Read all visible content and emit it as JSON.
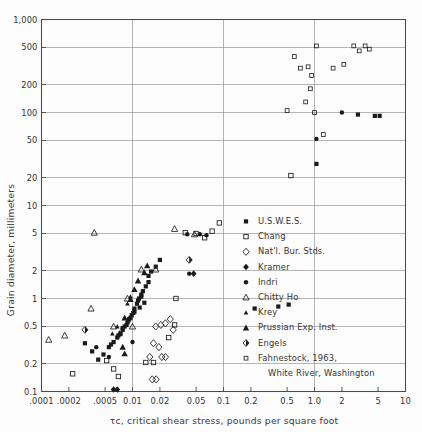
{
  "chart_data": {
    "type": "scatter",
    "title": "",
    "xlabel": "τc, critical shear stress, pounds per square foot",
    "ylabel": "Grain diameter, millimeters",
    "xscale": "log",
    "yscale": "log",
    "xlim": [
      0.001,
      10
    ],
    "ylim": [
      0.1,
      1000
    ],
    "grid": true,
    "legend_position": "inside-right",
    "xticks": [
      0.001,
      0.002,
      0.005,
      0.01,
      0.02,
      0.05,
      0.1,
      0.2,
      0.5,
      1.0,
      2,
      5,
      10
    ],
    "xtick_labels": [
      ".0001",
      ".0002",
      ".0005",
      "0.01",
      "0.02",
      "0.05",
      "0.1",
      "0.2",
      "0.5",
      "1.0",
      "2",
      "5",
      "10"
    ],
    "yticks": [
      0.1,
      0.2,
      0.5,
      1,
      2,
      5,
      10,
      20,
      50,
      100,
      200,
      500,
      1000
    ],
    "ytick_labels": [
      "0.1",
      "0.2",
      "0.5",
      "1",
      "2",
      "5",
      "10",
      "20",
      "50",
      "100",
      "200",
      "500",
      "1,000"
    ],
    "gridlines_x": [
      0.001,
      0.01,
      0.1,
      1.0,
      10
    ],
    "gridlines_y": [
      0.1,
      0.2,
      0.5,
      1,
      2,
      5,
      10,
      20,
      50,
      100,
      200,
      500,
      1000
    ],
    "series": [
      {
        "name": "U.S.W.E.S.",
        "marker": "filled-square",
        "points": [
          [
            0.4,
            0.82
          ],
          [
            0.52,
            0.86
          ],
          [
            0.22,
            0.78
          ],
          [
            0.0115,
            0.95
          ],
          [
            0.0125,
            1.05
          ],
          [
            0.013,
            1.2
          ],
          [
            0.014,
            1.35
          ],
          [
            0.015,
            1.5
          ],
          [
            0.0135,
            0.9
          ],
          [
            0.012,
            0.8
          ],
          [
            0.0105,
            0.72
          ],
          [
            0.0098,
            0.66
          ],
          [
            0.0092,
            0.6
          ],
          [
            0.0088,
            0.55
          ],
          [
            0.0082,
            0.5
          ],
          [
            0.0078,
            0.46
          ],
          [
            0.0074,
            0.42
          ],
          [
            0.015,
            1.75
          ],
          [
            0.016,
            1.95
          ],
          [
            0.0112,
            0.88
          ],
          [
            0.0102,
            0.7
          ],
          [
            0.0095,
            0.62
          ],
          [
            0.007,
            0.4
          ],
          [
            0.0062,
            0.34
          ],
          [
            0.009,
            0.58
          ],
          [
            0.0105,
            0.78
          ],
          [
            0.0118,
            1.0
          ],
          [
            0.0055,
            0.3
          ],
          [
            0.0048,
            0.25
          ],
          [
            0.0042,
            0.22
          ],
          [
            0.003,
            0.33
          ],
          [
            0.0036,
            0.27
          ],
          [
            0.0086,
            0.52
          ],
          [
            0.0078,
            0.48
          ],
          [
            0.0068,
            0.38
          ],
          [
            0.0058,
            0.32
          ],
          [
            0.018,
            2.2
          ],
          [
            0.02,
            2.6
          ],
          [
            0.0125,
            1.1
          ]
        ]
      },
      {
        "name": "Chang",
        "marker": "open-square",
        "points": [
          [
            0.0022,
            0.155
          ],
          [
            0.014,
            0.205
          ],
          [
            0.017,
            0.205
          ],
          [
            0.0062,
            0.175
          ],
          [
            0.007,
            0.145
          ],
          [
            0.0052,
            0.215
          ],
          [
            0.03,
            1.0
          ],
          [
            0.029,
            0.52
          ],
          [
            0.025,
            0.38
          ],
          [
            0.038,
            5.1
          ],
          [
            0.05,
            5.0
          ],
          [
            0.062,
            4.5
          ],
          [
            0.075,
            5.3
          ],
          [
            0.09,
            6.5
          ]
        ]
      },
      {
        "name": "Nat'l. Bur. Stds.",
        "marker": "open-diamond",
        "points": [
          [
            0.018,
            0.5
          ],
          [
            0.0205,
            0.52
          ],
          [
            0.023,
            0.54
          ],
          [
            0.026,
            0.6
          ],
          [
            0.028,
            0.46
          ],
          [
            0.017,
            0.33
          ],
          [
            0.0195,
            0.3
          ],
          [
            0.021,
            0.235
          ],
          [
            0.023,
            0.235
          ],
          [
            0.0165,
            0.135
          ],
          [
            0.0182,
            0.135
          ],
          [
            0.0155,
            0.235
          ]
        ]
      },
      {
        "name": "Kramer",
        "marker": "filled-diamond",
        "points": [
          [
            0.047,
            1.85
          ],
          [
            0.0062,
            0.105
          ],
          [
            0.0068,
            0.105
          ]
        ]
      },
      {
        "name": "Indri",
        "marker": "filled-circle",
        "points": [
          [
            0.055,
            4.9
          ],
          [
            0.065,
            4.8
          ],
          [
            0.04,
            4.9
          ],
          [
            0.042,
            1.85
          ],
          [
            0.01,
            0.34
          ],
          [
            0.004,
            0.3
          ],
          [
            0.0055,
            0.235
          ]
        ]
      },
      {
        "name": "Chitty Ho",
        "marker": "open-triangle",
        "points": [
          [
            0.0035,
            0.78
          ],
          [
            0.0018,
            0.4
          ],
          [
            0.0012,
            0.36
          ],
          [
            0.0088,
            1.0
          ],
          [
            0.0125,
            2.05
          ],
          [
            0.018,
            2.05
          ],
          [
            0.01,
            0.5
          ],
          [
            0.0038,
            5.1
          ],
          [
            0.029,
            5.6
          ],
          [
            0.048,
            4.9
          ],
          [
            0.0062,
            0.5
          ]
        ]
      },
      {
        "name": "Krey",
        "marker": "small-filled-triangle",
        "points": [
          [
            0.0088,
            0.88
          ],
          [
            0.0068,
            0.5
          ],
          [
            0.006,
            0.42
          ],
          [
            0.0095,
            1.05
          ]
        ]
      },
      {
        "name": "Prussian Exp. Inst.",
        "marker": "filled-triangle",
        "points": [
          [
            0.0115,
            1.55
          ],
          [
            0.0145,
            2.25
          ],
          [
            0.0105,
            1.25
          ],
          [
            0.0082,
            0.62
          ],
          [
            0.0072,
            0.42
          ],
          [
            0.0078,
            0.3
          ],
          [
            0.0082,
            0.255
          ],
          [
            0.0135,
            1.9
          ],
          [
            0.0095,
            0.98
          ]
        ]
      },
      {
        "name": "Engels",
        "marker": "half-filled-diamond",
        "points": [
          [
            0.042,
            2.6
          ],
          [
            0.003,
            0.46
          ]
        ]
      },
      {
        "name": "Fahnestock, 1963, White River, Washington",
        "marker": "small-open-square",
        "points": [
          [
            0.6,
            400
          ],
          [
            0.7,
            300
          ],
          [
            0.85,
            310
          ],
          [
            1.05,
            520
          ],
          [
            0.9,
            180
          ],
          [
            0.8,
            130
          ],
          [
            0.5,
            105
          ],
          [
            1.0,
            100
          ],
          [
            1.6,
            300
          ],
          [
            2.1,
            330
          ],
          [
            2.7,
            520
          ],
          [
            3.1,
            460
          ],
          [
            3.6,
            520
          ],
          [
            1.25,
            58
          ],
          [
            4.0,
            480
          ],
          [
            0.93,
            250
          ]
        ]
      }
    ],
    "extra_points": [
      {
        "marker": "filled-square",
        "x": 1.05,
        "y": 28
      },
      {
        "marker": "filled-square",
        "x": 3.0,
        "y": 95
      },
      {
        "marker": "filled-square",
        "x": 4.6,
        "y": 92
      },
      {
        "marker": "filled-square",
        "x": 5.2,
        "y": 92
      },
      {
        "marker": "filled-circle",
        "x": 1.05,
        "y": 52
      },
      {
        "marker": "filled-circle",
        "x": 2.0,
        "y": 100
      },
      {
        "marker": "open-square",
        "x": 0.55,
        "y": 21
      }
    ]
  },
  "legend": {
    "entries": [
      {
        "label": "U.S.W.E.S.",
        "marker": "filled-square"
      },
      {
        "label": "Chang",
        "marker": "open-square"
      },
      {
        "label": "Nat'l. Bur. Stds.",
        "marker": "open-diamond"
      },
      {
        "label": "Kramer",
        "marker": "filled-diamond"
      },
      {
        "label": "Indri",
        "marker": "filled-circle"
      },
      {
        "label": "Chitty Ho",
        "marker": "open-triangle"
      },
      {
        "label": "Krey",
        "marker": "small-filled-triangle"
      },
      {
        "label": "Prussian Exp. Inst.",
        "marker": "filled-triangle"
      },
      {
        "label": "Engels",
        "marker": "half-filled-diamond"
      },
      {
        "label": "Fahnestock, 1963,",
        "marker": "small-open-square"
      },
      {
        "label": "White River, Washington",
        "marker": "none"
      }
    ]
  },
  "colors": {
    "background": "#fdfdfd",
    "grid": "#8e8e8e",
    "frame": "#4a4a4a",
    "marker": "#1a1a1a",
    "text": "#333333"
  }
}
